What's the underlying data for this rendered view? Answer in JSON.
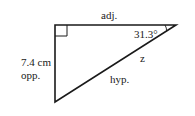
{
  "diagram": {
    "type": "right-triangle",
    "labels": {
      "adjacent": "adj.",
      "angle": "31.3°",
      "opposite_length": "7.4 cm",
      "opposite": "opp.",
      "hypotenuse_var": "z",
      "hypotenuse": "hyp."
    },
    "angle_value_deg": 31.3,
    "opposite_length_cm": 7.4,
    "colors": {
      "stroke": "#1a1a1a",
      "background": "#ffffff"
    }
  }
}
